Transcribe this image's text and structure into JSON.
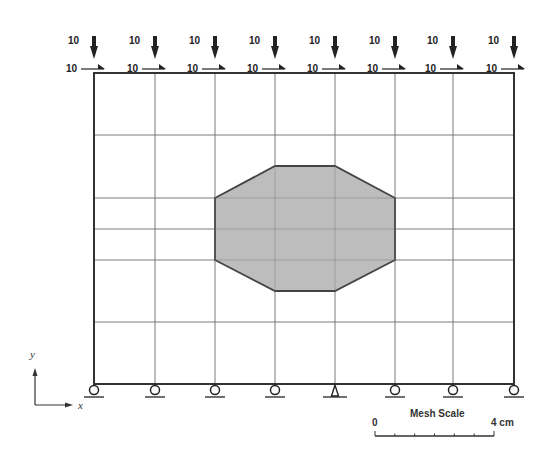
{
  "diagram": {
    "type": "finite-element-mesh",
    "mesh": {
      "x_lines": [
        94,
        155,
        215,
        275,
        335,
        395,
        453,
        514
      ],
      "y_lines": [
        73,
        135,
        198,
        229,
        260,
        322,
        384
      ],
      "border_color": "#333333",
      "grid_color": "#888888"
    },
    "inclusion": {
      "fill": "#bdbdbd",
      "stroke": "#444444",
      "points": [
        [
          215,
          198
        ],
        [
          275,
          166
        ],
        [
          335,
          166
        ],
        [
          395,
          198
        ],
        [
          395,
          260
        ],
        [
          335,
          291
        ],
        [
          275,
          291
        ],
        [
          215,
          260
        ]
      ]
    },
    "loads": {
      "vertical_label": "10",
      "horizontal_label": "10",
      "nodes": [
        94,
        155,
        215,
        275,
        335,
        395,
        453,
        514
      ]
    },
    "supports": {
      "roller_nodes": [
        94,
        155,
        215,
        275,
        395,
        453,
        514
      ],
      "pin_nodes": [
        335
      ]
    },
    "axes": {
      "x_label": "x",
      "y_label": "y"
    },
    "scale_bar": {
      "title": "Mesh Scale",
      "start_label": "0",
      "end_label": "4 cm",
      "ticks": 6
    }
  }
}
